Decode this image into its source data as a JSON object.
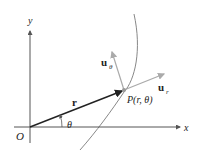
{
  "diagram": {
    "labels": {
      "y_axis": "y",
      "x_axis": "x",
      "origin": "O",
      "radius_vector": "r",
      "angle": "θ",
      "point": "P(r, θ)",
      "u_r_base": "u",
      "u_r_sub": "r",
      "u_theta_base": "u",
      "u_theta_sub": "θ"
    },
    "colors": {
      "axes": "#555555",
      "radius_vector": "#222222",
      "unit_vectors": "#aaaaaa",
      "curve": "#888888",
      "text": "#222222"
    }
  }
}
